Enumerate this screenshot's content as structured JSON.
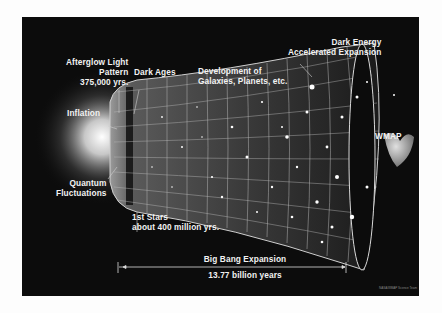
{
  "diagram": {
    "type": "cosmic-timeline",
    "colors": {
      "background": "#0c0c0c",
      "page": "#fdfdfd",
      "text": "#f2f2f2",
      "grid": "#bfbfbf"
    },
    "labels": {
      "afterglow": {
        "line1": "Afterglow Light",
        "line2": "Pattern",
        "line3": "375,000 yrs."
      },
      "dark_ages": "Dark Ages",
      "development": {
        "line1": "Development of",
        "line2": "Galaxies, Planets, etc."
      },
      "dark_energy": {
        "line1": "Dark Energy",
        "line2": "Accelerated Expansion"
      },
      "inflation": "Inflation",
      "quantum": {
        "line1": "Quantum",
        "line2": "Fluctuations"
      },
      "first_stars": {
        "line1": "1st Stars",
        "line2": "about 400 million yrs."
      },
      "wmap": "WMAP",
      "expansion": "Big Bang Expansion",
      "age": "13.77 billion years",
      "credit": "NASA/WMAP Science Team"
    }
  }
}
